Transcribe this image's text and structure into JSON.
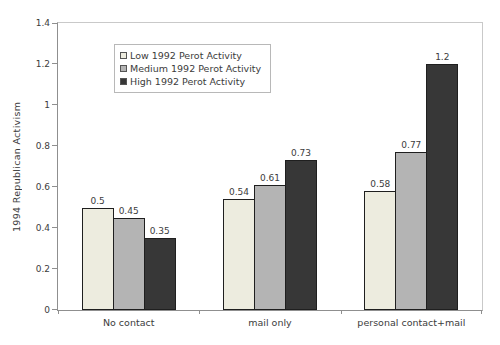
{
  "chart_data": {
    "type": "bar",
    "title": "",
    "ylabel": "1994 Republican Activism",
    "xlabel": "",
    "ylim": [
      0,
      1.4
    ],
    "yticks": [
      0,
      0.2,
      0.4,
      0.6,
      0.8,
      1,
      1.2,
      1.4
    ],
    "grid": false,
    "data_labels": true,
    "legend_position": "upper-left-inside",
    "categories": [
      "No contact",
      "mail only",
      "personal contact+mail"
    ],
    "series": [
      {
        "name": "Low 1992 Perot Activity",
        "color": "#edecdf",
        "values": [
          0.5,
          0.54,
          0.58
        ],
        "labels": [
          "0.5",
          "0.54",
          "0.58"
        ]
      },
      {
        "name": "Medium 1992 Perot Activity",
        "color": "#b4b4b4",
        "values": [
          0.45,
          0.61,
          0.77
        ],
        "labels": [
          "0.45",
          "0.61",
          "0.77"
        ]
      },
      {
        "name": "High 1992 Perot Activity",
        "color": "#373737",
        "values": [
          0.35,
          0.73,
          1.2
        ],
        "labels": [
          "0.35",
          "0.73",
          "1.2"
        ]
      }
    ],
    "colors": {
      "bar_border": "#1f1f1f",
      "axis": "#8f8f8f",
      "frame": "#c9c9c9",
      "text": "#3c3c3c",
      "background": "#ffffff"
    }
  }
}
